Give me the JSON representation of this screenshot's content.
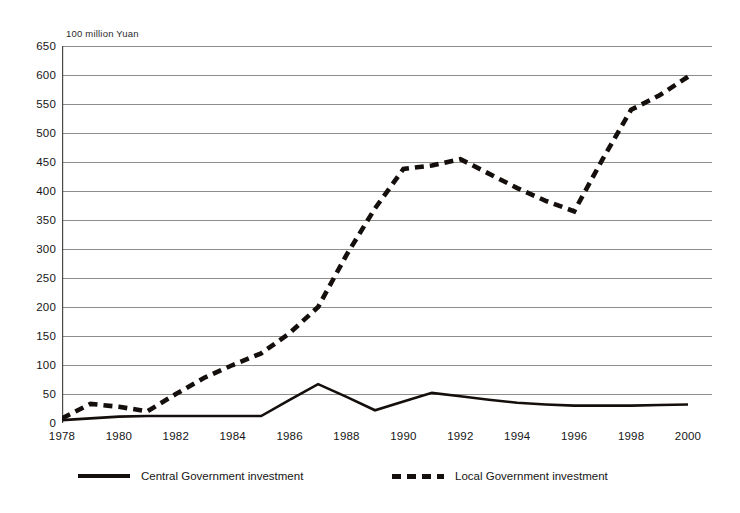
{
  "axis": {
    "unit_label": "100 million Yuan",
    "y_ticks": [
      0,
      50,
      100,
      150,
      200,
      250,
      300,
      350,
      400,
      450,
      500,
      550,
      600,
      650
    ],
    "x_ticks": [
      1978,
      1980,
      1982,
      1984,
      1986,
      1988,
      1990,
      1992,
      1994,
      1996,
      1998,
      2000
    ]
  },
  "legend": {
    "central_label": "Central Government investment",
    "local_label": "Local Government investment"
  },
  "colors": {
    "line": "#140f0c",
    "grid": "#8d8d8a",
    "axis": "#4a4a47",
    "background": "#ffffff",
    "text": "#161616"
  },
  "chart_data": {
    "type": "line",
    "title": "",
    "subtitle": "",
    "xlabel": "",
    "ylabel": "100 million Yuan",
    "xlim": [
      1978,
      2000
    ],
    "ylim": [
      0,
      650
    ],
    "grid": true,
    "legend_position": "bottom",
    "x": [
      1978,
      1979,
      1980,
      1981,
      1982,
      1983,
      1984,
      1985,
      1986,
      1987,
      1988,
      1989,
      1990,
      1991,
      1992,
      1993,
      1994,
      1995,
      1996,
      1997,
      1998,
      1999,
      2000
    ],
    "series": [
      {
        "name": "Central Government investment",
        "style": "solid",
        "values": [
          5,
          8,
          11,
          12,
          12,
          12,
          12,
          12,
          40,
          67,
          45,
          22,
          37,
          52,
          46,
          40,
          35,
          32,
          30,
          30,
          30,
          31,
          32
        ]
      },
      {
        "name": "Local Government investment",
        "style": "dashed",
        "values": [
          8,
          33,
          28,
          20,
          50,
          78,
          100,
          120,
          155,
          200,
          290,
          370,
          438,
          444,
          455,
          430,
          405,
          383,
          365,
          455,
          540,
          565,
          597
        ]
      }
    ]
  }
}
